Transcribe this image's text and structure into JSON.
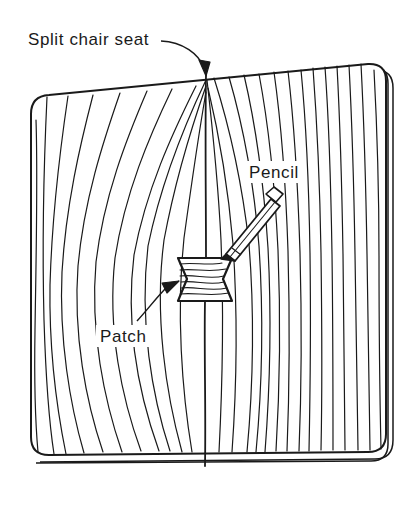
{
  "figure": {
    "background_color": "#ffffff",
    "line_color": "#1a1a1a",
    "labels": {
      "split": "Split chair seat",
      "pencil": "Pencil",
      "patch": "Patch"
    },
    "annotations": [
      {
        "name": "split-chair-seat",
        "label": "Split chair seat",
        "text_x": 28,
        "text_y": 45,
        "leader_from": [
          160,
          40
        ],
        "leader_to": [
          206,
          74
        ]
      },
      {
        "name": "pencil",
        "label": "Pencil",
        "text_x": 249,
        "text_y": 178,
        "leader_from": null,
        "leader_to": null
      },
      {
        "name": "patch",
        "label": "Patch",
        "text_x": 100,
        "text_y": 342,
        "leader_from": [
          138,
          322
        ],
        "leader_to": [
          179,
          281
        ]
      }
    ],
    "objects": {
      "board": {
        "name": "chair-seat-board",
        "description": "wooden chair seat panel in perspective with rounded corners and visible edge thickness",
        "corners": [
          [
            31,
            97
          ],
          [
            369,
            63
          ],
          [
            386,
            452
          ],
          [
            28,
            455
          ]
        ],
        "corner_radius": 18,
        "edge_thickness": 7
      },
      "split": {
        "name": "split-crack",
        "description": "vertical crack running from top edge down through the patch to bottom edge",
        "top": [
          206,
          74
        ],
        "bottom": [
          205,
          466
        ]
      },
      "patch": {
        "name": "bowtie-patch",
        "description": "hourglass / bowtie shaped inlay patch spanning the split with horizontal grain",
        "left": 178,
        "right": 232,
        "top": 258,
        "bottom": 301,
        "waist_inset": 9,
        "grain_lines": 7
      },
      "pencil": {
        "name": "pencil-tool",
        "description": "pencil marking the patch outline, tip at the patch edge",
        "tip": [
          221,
          259
        ],
        "end": [
          277,
          190
        ],
        "width": 11,
        "ferrule_ratio": 0.78,
        "tip_ratio": 0.18
      }
    },
    "grain": {
      "left_field_lines": 11,
      "right_field_lines": 15,
      "description": "wood grain curves sweeping toward the split from both sides"
    }
  }
}
